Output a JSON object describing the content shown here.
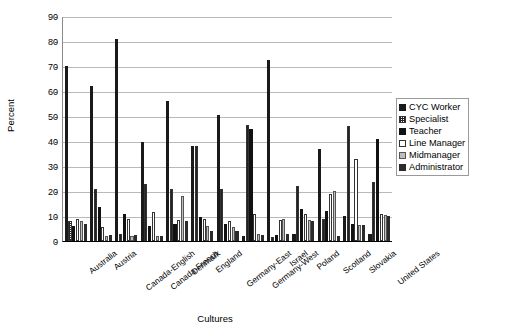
{
  "chart_data": {
    "type": "bar",
    "title": "",
    "xlabel": "Cultures",
    "ylabel": "Percent",
    "ylim": [
      0,
      90
    ],
    "yticks": [
      0,
      10,
      20,
      30,
      40,
      50,
      60,
      70,
      80,
      90
    ],
    "grid": true,
    "legend_position": "right",
    "categories": [
      "Australia",
      "Austria",
      "Canada-English",
      "Canada-French",
      "Denmark",
      "England",
      "Germany-East",
      "Germany-West",
      "Israel",
      "Poland",
      "Scotland",
      "Slovakia",
      "United States"
    ],
    "series": [
      {
        "name": "CYC Worker",
        "key": "sw-cyc",
        "values": [
          70,
          62,
          81,
          39.5,
          56,
          38,
          50.5,
          2,
          72.5,
          3,
          37,
          10,
          3
        ]
      },
      {
        "name": "Specialist",
        "key": "sw-spec",
        "values": [
          8,
          21,
          3,
          23,
          21,
          38,
          21,
          46.5,
          1.5,
          22,
          9,
          46,
          23.5
        ]
      },
      {
        "name": "Teacher",
        "key": "sw-teach",
        "values": [
          6,
          13.5,
          11,
          6,
          7,
          9.5,
          7,
          45,
          2.5,
          13,
          12,
          7,
          41
        ]
      },
      {
        "name": "Line Manager",
        "key": "sw-line",
        "values": [
          9,
          5.5,
          9,
          11.5,
          8.5,
          9,
          8,
          11,
          8.5,
          11,
          19,
          33,
          11
        ]
      },
      {
        "name": "Midmanager",
        "key": "sw-mid",
        "values": [
          8,
          2,
          2,
          2,
          18,
          6,
          5.5,
          3,
          9,
          8.5,
          20,
          6.5,
          10.5
        ]
      },
      {
        "name": "Administrator",
        "key": "sw-admin",
        "values": [
          7,
          2.5,
          2.5,
          2,
          8,
          4,
          4,
          2.5,
          3,
          8,
          2,
          6.5,
          10
        ]
      }
    ]
  },
  "legend": {
    "items": [
      {
        "label": "CYC Worker"
      },
      {
        "label": "Specialist"
      },
      {
        "label": "Teacher"
      },
      {
        "label": "Line Manager"
      },
      {
        "label": "Midmanager"
      },
      {
        "label": "Administrator"
      }
    ]
  }
}
